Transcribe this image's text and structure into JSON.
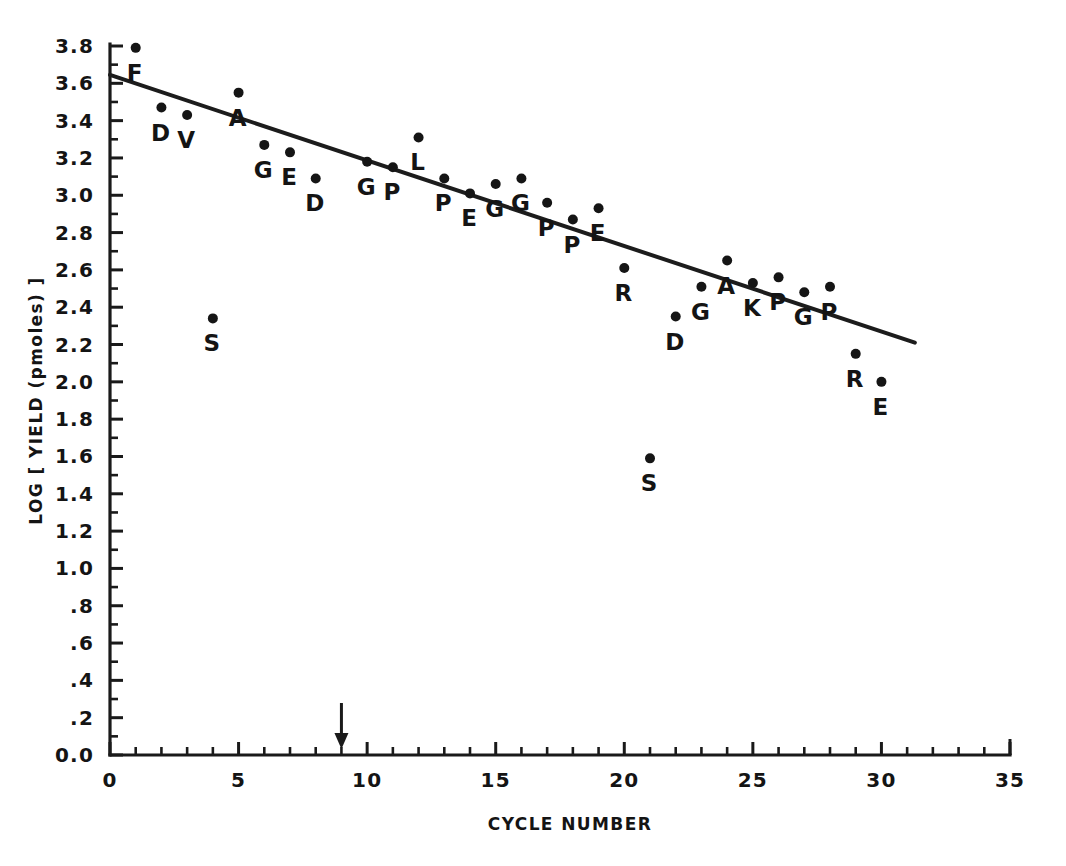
{
  "chart_data": {
    "type": "scatter",
    "title": "",
    "subtitle": "",
    "xlabel": "CYCLE NUMBER",
    "ylabel": "LOG [ YIELD (pmoles) ]",
    "xlim": [
      0,
      35
    ],
    "ylim": [
      0.0,
      3.8
    ],
    "grid": false,
    "legend": null,
    "x_ticks": [
      0,
      5,
      10,
      15,
      20,
      25,
      30,
      35
    ],
    "x_tick_labels": [
      "0",
      "5",
      "10",
      "15",
      "20",
      "25",
      "30",
      "35"
    ],
    "x_minor_tick_step": 1,
    "y_ticks": [
      0.0,
      0.2,
      0.4,
      0.6,
      0.8,
      1.0,
      1.2,
      1.4,
      1.6,
      1.8,
      2.0,
      2.2,
      2.4,
      2.6,
      2.8,
      3.0,
      3.2,
      3.4,
      3.6,
      3.8
    ],
    "y_tick_labels": [
      "0.0",
      ".2",
      ".4",
      ".6",
      ".8",
      "1.0",
      "1.2",
      "1.4",
      "1.6",
      "1.8",
      "2.0",
      "2.2",
      "2.4",
      "2.6",
      "2.8",
      "3.0",
      "3.2",
      "3.4",
      "3.6",
      "3.8"
    ],
    "point_marker": "filled-circle",
    "series": [
      {
        "name": "residue yield",
        "x": [
          1,
          2,
          3,
          4,
          5,
          6,
          7,
          8,
          10,
          11,
          12,
          13,
          14,
          15,
          16,
          17,
          18,
          19,
          20,
          21,
          22,
          23,
          24,
          25,
          26,
          27,
          28,
          29,
          30
        ],
        "values": [
          3.79,
          3.47,
          3.43,
          2.34,
          3.55,
          3.27,
          3.23,
          3.09,
          3.18,
          3.15,
          3.31,
          3.09,
          3.01,
          3.06,
          3.09,
          2.96,
          2.87,
          2.93,
          2.61,
          1.59,
          2.35,
          2.51,
          2.65,
          2.53,
          2.56,
          2.48,
          2.51,
          2.15,
          2.0
        ],
        "labels": [
          "F",
          "D",
          "V",
          "S",
          "A",
          "G",
          "E",
          "D",
          "G",
          "P",
          "L",
          "P",
          "E",
          "G",
          "G",
          "P",
          "P",
          "E",
          "R",
          "S",
          "D",
          "G",
          "A",
          "K",
          "P",
          "G",
          "P",
          "R",
          "E"
        ]
      }
    ],
    "fit_line": {
      "type": "linear-regression",
      "x_start": 0.0,
      "y_start": 3.645,
      "x_end": 31.3,
      "y_end": 2.21
    },
    "annotations": [
      {
        "name": "cycle-9-arrow",
        "type": "down-arrow",
        "x": 9,
        "y": 0.0,
        "label": ""
      }
    ]
  }
}
